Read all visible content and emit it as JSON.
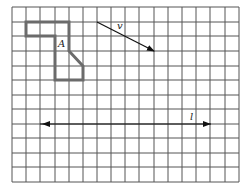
{
  "figure": {
    "grid": {
      "columns": 16,
      "rows": 12,
      "x_lines": [
        12,
        26,
        40,
        55,
        69,
        83,
        97,
        111,
        125,
        139,
        154,
        168,
        182,
        196,
        210,
        225,
        239
      ],
      "y_lines": [
        7,
        22,
        36,
        51,
        66,
        80,
        95,
        109,
        124,
        138,
        153,
        167,
        182
      ],
      "line_color": "#555555"
    },
    "shape": {
      "label": "A",
      "grid_vertices": [
        [
          1,
          1
        ],
        [
          4,
          1
        ],
        [
          4,
          3
        ],
        [
          5,
          4
        ],
        [
          5,
          5
        ],
        [
          3,
          5
        ],
        [
          3,
          2
        ],
        [
          1,
          2
        ]
      ],
      "stroke_color": "#666666"
    },
    "vector": {
      "label": "v",
      "from_grid": [
        6,
        1
      ],
      "to_grid": [
        10,
        3
      ]
    },
    "line": {
      "label": "l",
      "row_line": 8,
      "direction": "horizontal, arrows both ends"
    }
  }
}
